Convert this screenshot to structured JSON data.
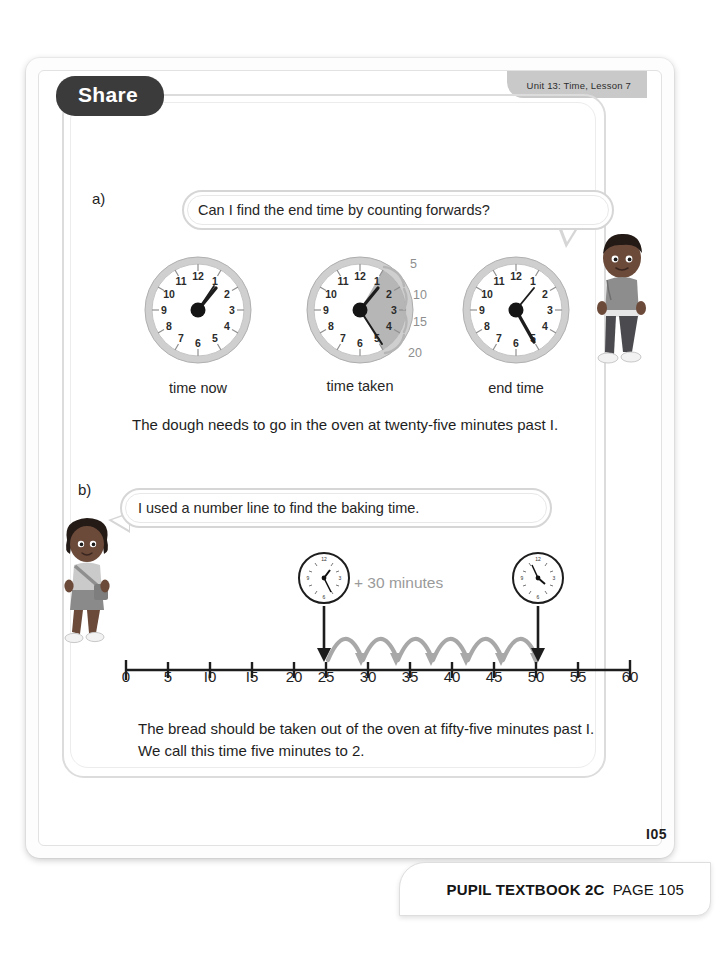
{
  "unit_tab": {
    "label": "Unit 13: Time, Lesson 7"
  },
  "section": {
    "badge": "Share",
    "marker_a": "a)",
    "marker_b": "b)"
  },
  "bubbles": {
    "a": "Can I find the end time by counting forwards?",
    "b": "I used a number line to find the baking time."
  },
  "clocks": {
    "labels": [
      "time now",
      "time taken",
      "end time"
    ],
    "faces": [
      {
        "name": "time-now-clock",
        "hour": 1,
        "minute": 0,
        "shaded": false
      },
      {
        "name": "time-taken-clock",
        "hour": 1,
        "minute": 25,
        "shaded": true,
        "arc_labels": [
          "5",
          "10",
          "15",
          "20"
        ]
      },
      {
        "name": "end-time-clock",
        "hour": 1,
        "minute": 25,
        "shaded": false
      }
    ],
    "numerals": [
      "12",
      "1",
      "2",
      "3",
      "4",
      "5",
      "6",
      "7",
      "8",
      "9",
      "10",
      "11"
    ]
  },
  "paragraphs": {
    "a": "The dough needs to go in the oven at twenty-five minutes past I.",
    "b": "The bread should be taken out of the oven at fifty-five minutes past I. We call this time five minutes to 2."
  },
  "number_line": {
    "label": "+ 30 minutes",
    "ticks": [
      "0",
      "5",
      "I0",
      "I5",
      "20",
      "25",
      "30",
      "35",
      "40",
      "45",
      "50",
      "55",
      "60"
    ],
    "start_value": 25,
    "end_value": 55,
    "hop_count": 6,
    "hop_size": 5,
    "start_clock": {
      "hour": 1,
      "minute": 25
    },
    "end_clock": {
      "hour": 1,
      "minute": 55
    }
  },
  "characters": [
    {
      "name": "boy-character",
      "position": "right"
    },
    {
      "name": "girl-character",
      "position": "left"
    }
  ],
  "footer": {
    "page_number": "I05",
    "book_label": "PUPIL TEXTBOOK 2C",
    "page_label": "PAGE 105"
  },
  "colors": {
    "badge_bg": "#3b3b3b",
    "unit_tab_bg": "#c9c9c9",
    "arrow_gray": "#a8a8a8",
    "label_gray": "#9a9a9a",
    "clock_rim": "#b9b9b9",
    "shade_fill": "#a9a9a9"
  }
}
